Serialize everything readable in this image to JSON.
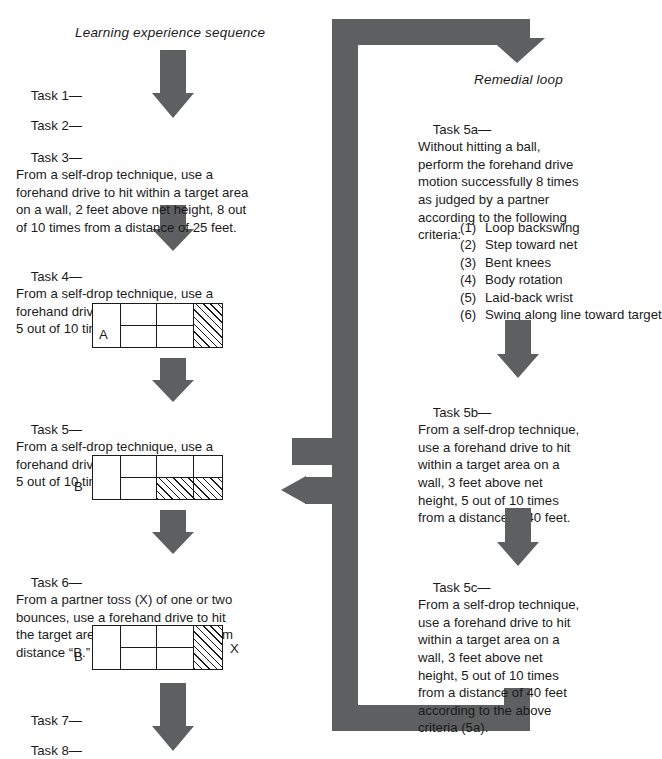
{
  "page": {
    "background": "#ffffff",
    "arrow_color": "#5d5f60",
    "ink_color": "#1b1b1b"
  },
  "headings": {
    "left": "Learning experience sequence",
    "right": "Remedial loop"
  },
  "left_column": {
    "tasks": [
      {
        "id": "task-1",
        "label": "Task 1—",
        "body": ""
      },
      {
        "id": "task-2",
        "label": "Task 2—",
        "body": ""
      },
      {
        "id": "task-3",
        "label": "Task 3—",
        "body": "From a self-drop technique, use a\nforehand drive to hit within a target area\non a wall, 2 feet above net height, 8 out\nof 10 times from a distance of 25 feet."
      },
      {
        "id": "task-4",
        "label": "Task 4—",
        "body": "From a self-drop technique, use a\nforehand drive to hit the target area\n5 out of 10 times from distance “A.”"
      },
      {
        "id": "task-5",
        "label": "Task 5—",
        "body": "From a self-drop technique, use a\nforehand drive to hit the target area\n5 out of 10 times from distance “B.”"
      },
      {
        "id": "task-6",
        "label": "Task 6—",
        "body": "From a partner toss (X) of one or two\nbounces, use a forehand drive to hit\nthe target area 5 out of 10 times from\ndistance “B.”"
      },
      {
        "id": "task-7",
        "label": "Task 7—",
        "body": ""
      },
      {
        "id": "task-8",
        "label": "Task 8—",
        "body": ""
      }
    ],
    "diagrams": [
      {
        "id": "target-a",
        "inside_label": "A",
        "side_label_left": "",
        "side_label_right": ""
      },
      {
        "id": "target-b-5",
        "inside_label": "",
        "side_label_left": "B",
        "side_label_right": ""
      },
      {
        "id": "target-b-6",
        "inside_label": "",
        "side_label_left": "B",
        "side_label_right": "X"
      }
    ]
  },
  "right_column": {
    "tasks": [
      {
        "id": "task-5a",
        "label": "Task 5a—",
        "body": "Without hitting a ball,\nperform the forehand drive\nmotion successfully 8 times\nas judged by a partner\naccording to the following\ncriteria:"
      },
      {
        "id": "task-5b",
        "label": "Task 5b—",
        "body": "From a self-drop technique,\nuse a forehand drive to hit\nwithin a target area on a\nwall, 3 feet above net\nheight, 5 out of 10 times\nfrom a distance of 40 feet."
      },
      {
        "id": "task-5c",
        "label": "Task 5c—",
        "body": "From a self-drop technique,\nuse a forehand drive to hit\nwithin a target area on a\nwall, 3 feet above net\nheight, 5 out of 10 times\nfrom a distance of 40 feet\naccording to the above\ncriteria (5a)."
      }
    ],
    "criteria": [
      {
        "num": "(1)",
        "text": "Loop backswing"
      },
      {
        "num": "(2)",
        "text": "Step toward net"
      },
      {
        "num": "(3)",
        "text": "Bent knees"
      },
      {
        "num": "(4)",
        "text": "Body rotation"
      },
      {
        "num": "(5)",
        "text": "Laid-back wrist"
      },
      {
        "num": "(6)",
        "text": "Swing along line toward target"
      }
    ]
  }
}
